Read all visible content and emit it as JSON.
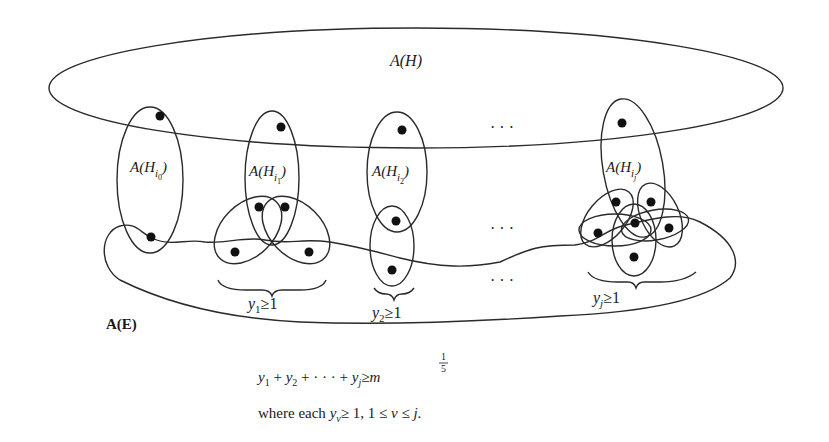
{
  "diagram": {
    "outer_set_label": "A(H)",
    "edge_set_label": "A(E)",
    "ellipsis": "· · ·",
    "subsets": [
      {
        "id": "i0",
        "label_main": "A(H",
        "label_sub": "i",
        "label_subsub": "0",
        "label_close": ")"
      },
      {
        "id": "i1",
        "label_main": "A(H",
        "label_sub": "i",
        "label_subsub": "1",
        "label_close": ")"
      },
      {
        "id": "i2",
        "label_main": "A(H",
        "label_sub": "i",
        "label_subsub": "2",
        "label_close": ")"
      },
      {
        "id": "ij",
        "label_main": "A(H",
        "label_sub": "i",
        "label_subsub": "j",
        "label_close": ")"
      }
    ],
    "brace_labels": [
      {
        "var": "y",
        "sub": "1",
        "rel": "≥1"
      },
      {
        "var": "y",
        "sub": "2",
        "rel": "≥1"
      },
      {
        "var": "y",
        "sub": "j",
        "rel": "≥1"
      }
    ]
  },
  "caption": {
    "equation": {
      "y1": "y",
      "s1": "1",
      "plus1": " + ",
      "y2": "y",
      "s2": "2",
      "plus2": " + · · · + ",
      "yj": "y",
      "sj": "j",
      "geq": "≥",
      "m": "m",
      "exp_num": "1",
      "exp_den": "5"
    },
    "condition": {
      "where": "where each ",
      "y": "y",
      "nu": "ν",
      "rest": "≥ 1, 1 ≤ ",
      "nu2": "ν",
      "end": " ≤ ",
      "j": "j",
      "period": "."
    }
  }
}
